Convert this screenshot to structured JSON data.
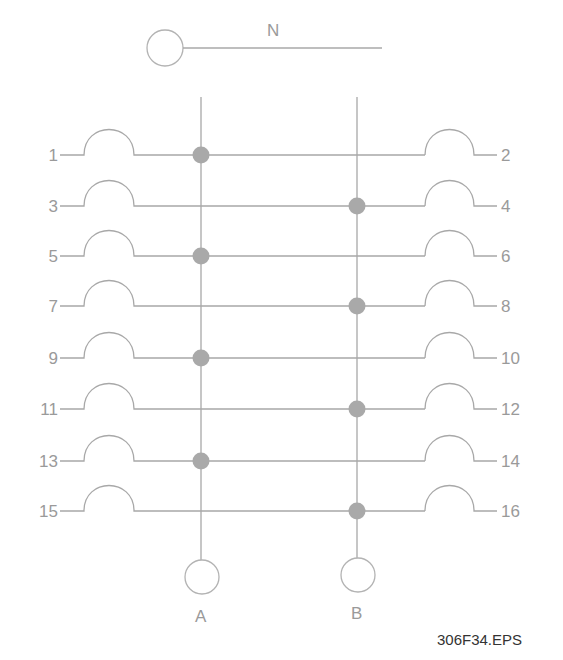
{
  "diagram": {
    "neutral": {
      "label": "N"
    },
    "buses": [
      {
        "label": "A",
        "x": 201
      },
      {
        "label": "B",
        "x": 357
      }
    ],
    "rows": [
      {
        "left": "1",
        "right": "2",
        "y": 155,
        "bus": "A"
      },
      {
        "left": "3",
        "right": "4",
        "y": 206,
        "bus": "B"
      },
      {
        "left": "5",
        "right": "6",
        "y": 256,
        "bus": "A"
      },
      {
        "left": "7",
        "right": "8",
        "y": 306,
        "bus": "B"
      },
      {
        "left": "9",
        "right": "10",
        "y": 358,
        "bus": "A"
      },
      {
        "left": "11",
        "right": "12",
        "y": 409,
        "bus": "B"
      },
      {
        "left": "13",
        "right": "14",
        "y": 461,
        "bus": "A"
      },
      {
        "left": "15",
        "right": "16",
        "y": 511,
        "bus": "B"
      }
    ],
    "figure_id": "306F34.EPS",
    "colors": {
      "line": "#a8a8a8",
      "node": "#a9a9a9",
      "label": "#9a9a9a",
      "figure_id": "#333333"
    }
  }
}
